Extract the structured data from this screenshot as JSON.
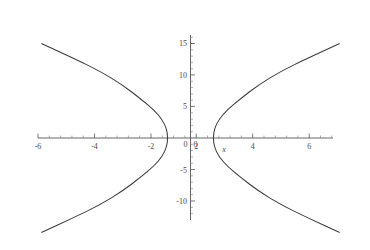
{
  "chart_data": {
    "type": "line",
    "title": "",
    "subtitle": "",
    "xlabel": "x",
    "ylabel": "",
    "xlim": [
      -6.6,
      6.6
    ],
    "ylim": [
      -12.5,
      17.0
    ],
    "grid": false,
    "legend": false,
    "legend_position": "none",
    "x_ticks": [
      -6,
      -4,
      -2,
      0,
      2,
      4,
      6
    ],
    "x_tick_labels": [
      "-6",
      "-4",
      "-2",
      "0",
      "2",
      "4",
      "6"
    ],
    "x_minor_tick_step": 0.5,
    "y_ticks": [
      -10,
      -5,
      0,
      5,
      10,
      15
    ],
    "y_tick_labels": [
      "-10",
      "-5",
      "0",
      "5",
      "10",
      "15"
    ],
    "y_minor_tick_step": 1,
    "origin_label": "0",
    "axis_color": "#555555",
    "curve_color": "#3a3a3a",
    "frame_color": "#8a8a8a",
    "background_color": "#ffffff",
    "series": [
      {
        "name": "right-branch",
        "description": "Sideways parabola opening right, vertex at (1, 0)",
        "vertex": [
          1,
          0
        ],
        "points": [
          [
            6.6,
            15.0
          ],
          [
            5.2,
            12.7
          ],
          [
            4.0,
            10.6
          ],
          [
            3.0,
            8.4
          ],
          [
            2.2,
            6.2
          ],
          [
            1.6,
            4.4
          ],
          [
            1.25,
            2.9
          ],
          [
            1.06,
            1.5
          ],
          [
            1.0,
            0.0
          ],
          [
            1.06,
            -1.5
          ],
          [
            1.25,
            -2.9
          ],
          [
            1.6,
            -4.4
          ],
          [
            2.2,
            -6.2
          ],
          [
            3.0,
            -8.4
          ],
          [
            4.0,
            -10.6
          ],
          [
            5.2,
            -12.7
          ],
          [
            6.6,
            -15.0
          ]
        ]
      },
      {
        "name": "left-branch",
        "description": "Sideways parabola opening left, vertex at (-1, 0)",
        "vertex": [
          -1,
          0
        ],
        "points": [
          [
            -6.6,
            15.0
          ],
          [
            -5.2,
            12.7
          ],
          [
            -4.0,
            10.6
          ],
          [
            -3.0,
            8.4
          ],
          [
            -2.2,
            6.2
          ],
          [
            -1.6,
            4.4
          ],
          [
            -1.25,
            2.9
          ],
          [
            -1.06,
            1.5
          ],
          [
            -1.0,
            0.0
          ],
          [
            -1.06,
            -1.5
          ],
          [
            -1.25,
            -2.9
          ],
          [
            -1.6,
            -4.4
          ],
          [
            -2.2,
            -6.2
          ],
          [
            -3.0,
            -8.4
          ],
          [
            -4.0,
            -10.6
          ],
          [
            -5.2,
            -12.7
          ],
          [
            -6.6,
            -15.0
          ]
        ]
      }
    ]
  },
  "labels": {
    "x_axis_name": "x",
    "y15": "15",
    "y10": "10",
    "y5": "5",
    "y0": "0",
    "ym5": "-5",
    "ym10": "-10",
    "xm6": "-6",
    "xm4": "-4",
    "xm2": "-2",
    "x0": "0",
    "x2": "2",
    "x4": "4",
    "x6": "6"
  }
}
